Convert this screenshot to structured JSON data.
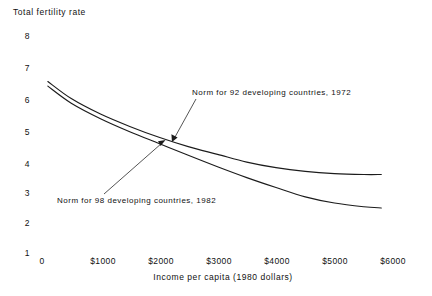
{
  "chart_data": {
    "type": "line",
    "title": "",
    "ylabel": "Total fertility rate",
    "xlabel": "Income per capita (1980 dollars)",
    "xlim": [
      0,
      6000
    ],
    "ylim": [
      1,
      8
    ],
    "grid": false,
    "legend_position": "inline-annotations",
    "y_ticks": [
      "8",
      "7",
      "6",
      "5",
      "4",
      "3",
      "2",
      "1"
    ],
    "y_tick_values": [
      8,
      7,
      6,
      5,
      4,
      3,
      2,
      1
    ],
    "x_ticks": [
      "0",
      "$1000",
      "$2000",
      "$3000",
      "$4000",
      "$5000",
      "$6000"
    ],
    "x_tick_values": [
      0,
      1000,
      2000,
      3000,
      4000,
      5000,
      6000
    ],
    "series": [
      {
        "name": "Norm for 92 developing countries, 1972",
        "x": [
          100,
          500,
          1000,
          1500,
          2000,
          2500,
          3000,
          3500,
          4000,
          4500,
          5000,
          5500,
          5800
        ],
        "values": [
          6.5,
          5.95,
          5.45,
          5.05,
          4.7,
          4.4,
          4.15,
          3.9,
          3.72,
          3.6,
          3.53,
          3.5,
          3.5
        ]
      },
      {
        "name": "Norm for 98 developing countries, 1982",
        "x": [
          100,
          500,
          1000,
          1500,
          2000,
          2500,
          3000,
          3500,
          4000,
          4500,
          5000,
          5500,
          5800
        ],
        "values": [
          6.35,
          5.8,
          5.3,
          4.88,
          4.5,
          4.12,
          3.75,
          3.4,
          3.08,
          2.78,
          2.58,
          2.46,
          2.42
        ]
      }
    ],
    "annotations": [
      {
        "text": "Norm for 92 developing countries, 1972",
        "points_to_series": "Norm for 92 developing countries, 1972"
      },
      {
        "text": "Norm for 98 developing countries, 1982",
        "points_to_series": "Norm for 98 developing countries, 1982"
      }
    ]
  },
  "axes": {
    "y_title": "Total fertility rate",
    "x_title": "Income per capita (1980 dollars)"
  },
  "y_ticks": [
    {
      "label": "8"
    },
    {
      "label": "7"
    },
    {
      "label": "6"
    },
    {
      "label": "5"
    },
    {
      "label": "4"
    },
    {
      "label": "3"
    },
    {
      "label": "2"
    },
    {
      "label": "1"
    }
  ],
  "x_ticks": [
    {
      "label": "0"
    },
    {
      "label": "$1000"
    },
    {
      "label": "$2000"
    },
    {
      "label": "$3000"
    },
    {
      "label": "$4000"
    },
    {
      "label": "$5000"
    },
    {
      "label": "$6000"
    }
  ],
  "annotations": {
    "upper": "Norm for 92 developing countries, 1972",
    "lower": "Norm for 98 developing countries, 1982"
  },
  "colors": {
    "background": "#ffffff",
    "ink": "#1c1c1c"
  }
}
